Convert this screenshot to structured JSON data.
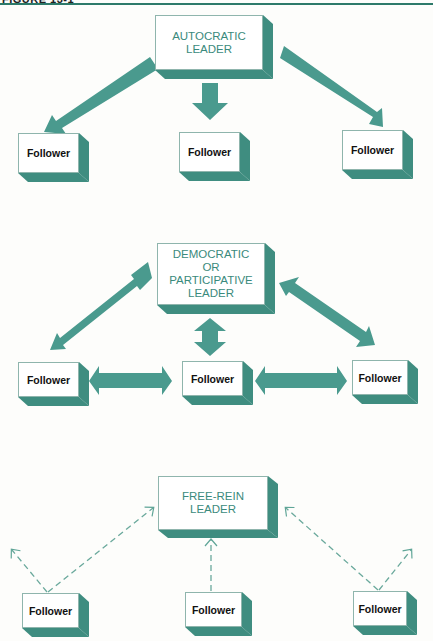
{
  "header": {
    "title": "FIGURE 13-1"
  },
  "colors": {
    "accent": "#4a9a8e",
    "shadow": "#3f8d80",
    "leader_text": "#3a8a7c",
    "rule": "#2d7a6a"
  },
  "sections": [
    {
      "name": "autocratic",
      "leader": {
        "line1": "AUTOCRATIC",
        "line2": "LEADER"
      },
      "arrow_style": "solid-one-way-down",
      "followers": [
        "Follower",
        "Follower",
        "Follower"
      ]
    },
    {
      "name": "democratic",
      "leader": {
        "line1": "DEMOCRATIC",
        "line2": "OR",
        "line3": "PARTICIPATIVE",
        "line4": "LEADER"
      },
      "arrow_style": "solid-two-way",
      "followers": [
        "Follower",
        "Follower",
        "Follower"
      ]
    },
    {
      "name": "free-rein",
      "leader": {
        "line1": "FREE-REIN",
        "line2": "LEADER"
      },
      "arrow_style": "dashed-upward",
      "followers": [
        "Follower",
        "Follower",
        "Follower"
      ]
    }
  ]
}
